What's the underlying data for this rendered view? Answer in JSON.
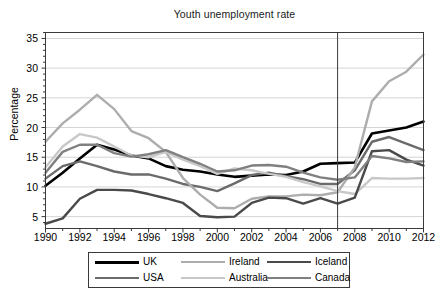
{
  "chart_data": {
    "type": "line",
    "title": "Youth unemployment rate",
    "xlabel": "",
    "ylabel": "Percentage",
    "xlim": [
      1990,
      2012
    ],
    "ylim": [
      3,
      36
    ],
    "yticks": [
      5,
      10,
      15,
      20,
      25,
      30,
      35
    ],
    "xticks": [
      1990,
      1992,
      1994,
      1996,
      1998,
      2000,
      2002,
      2004,
      2006,
      2008,
      2010,
      2012
    ],
    "grid": "horizontal",
    "legend_position": "below-plot",
    "annotations": [
      {
        "type": "vertical-line",
        "x": 2007,
        "label": ""
      }
    ],
    "x": [
      1990,
      1991,
      1992,
      1993,
      1994,
      1995,
      1996,
      1997,
      1998,
      1999,
      2000,
      2001,
      2002,
      2003,
      2004,
      2005,
      2006,
      2007,
      2008,
      2009,
      2010,
      2011,
      2012
    ],
    "series": [
      {
        "name": "UK",
        "color": "#000000",
        "width": 2.6,
        "values": [
          10.2,
          12.4,
          14.8,
          17.1,
          16.3,
          15.3,
          14.8,
          13.5,
          12.9,
          12.6,
          12.1,
          11.7,
          11.9,
          12.1,
          12.0,
          12.6,
          13.9,
          14.0,
          14.1,
          19.0,
          19.5,
          20.0,
          21.0
        ]
      },
      {
        "name": "USA",
        "color": "#6b6b6b",
        "width": 2.4,
        "values": [
          11.4,
          13.5,
          14.3,
          13.5,
          12.6,
          12.1,
          12.1,
          11.4,
          10.5,
          10.0,
          9.3,
          10.6,
          12.0,
          12.4,
          11.8,
          11.3,
          10.5,
          10.5,
          12.8,
          17.6,
          18.4,
          17.3,
          16.2
        ]
      },
      {
        "name": "Ireland",
        "color": "#adadad",
        "width": 2.4,
        "values": [
          17.6,
          20.7,
          23.0,
          25.5,
          23.1,
          19.4,
          18.2,
          15.9,
          11.5,
          8.7,
          6.5,
          6.4,
          8.0,
          8.4,
          8.4,
          8.7,
          8.6,
          9.1,
          13.3,
          24.4,
          27.8,
          29.4,
          32.3
        ]
      },
      {
        "name": "Australia",
        "color": "#c8c8c8",
        "width": 2.4,
        "values": [
          13.3,
          16.8,
          18.9,
          18.3,
          16.8,
          15.3,
          15.0,
          15.9,
          14.6,
          13.5,
          12.2,
          13.1,
          12.8,
          12.2,
          11.7,
          10.8,
          10.1,
          9.3,
          8.8,
          11.5,
          11.4,
          11.4,
          11.5
        ]
      },
      {
        "name": "Iceland",
        "color": "#4a4a4a",
        "width": 2.4,
        "values": [
          3.8,
          4.7,
          8.0,
          9.5,
          9.5,
          9.4,
          8.8,
          8.1,
          7.3,
          5.1,
          4.9,
          5.0,
          7.3,
          8.2,
          8.1,
          7.2,
          8.1,
          7.2,
          8.2,
          16.0,
          16.2,
          14.6,
          13.6
        ]
      },
      {
        "name": "Canada",
        "color": "#808080",
        "width": 2.4,
        "values": [
          12.4,
          15.9,
          17.1,
          17.1,
          15.7,
          15.1,
          15.5,
          16.2,
          15.0,
          13.9,
          12.6,
          12.8,
          13.6,
          13.7,
          13.4,
          12.4,
          11.6,
          11.2,
          11.6,
          15.2,
          14.8,
          14.2,
          14.3
        ]
      }
    ]
  },
  "legend": {
    "entries": [
      {
        "label": "UK"
      },
      {
        "label": "Ireland"
      },
      {
        "label": "Iceland"
      },
      {
        "label": "USA"
      },
      {
        "label": "Australia"
      },
      {
        "label": "Canada"
      }
    ]
  }
}
